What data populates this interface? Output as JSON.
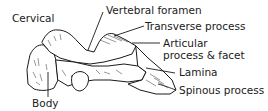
{
  "diagram": {
    "title": "Cervical",
    "labels": [
      {
        "id": "vertebral-foramen",
        "text": "Vertebral foramen"
      },
      {
        "id": "transverse-process",
        "text": "Transverse process"
      },
      {
        "id": "articular-1",
        "text": "Articular"
      },
      {
        "id": "articular-2",
        "text": "process & facet"
      },
      {
        "id": "lamina",
        "text": "Lamina"
      },
      {
        "id": "spinous-process",
        "text": "Spinous process"
      },
      {
        "id": "body",
        "text": "Body"
      }
    ],
    "colors": {
      "ink": "#1a1a1a",
      "background": "#ffffff"
    }
  }
}
